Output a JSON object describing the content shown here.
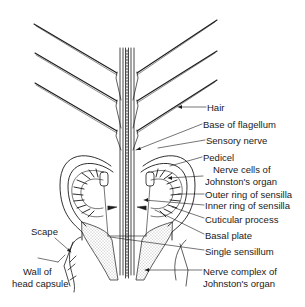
{
  "diagram": {
    "labels_right": [
      {
        "id": "hair",
        "text": "Hair",
        "x": 207,
        "y": 102
      },
      {
        "id": "base-of-flagellum",
        "text": "Base of flagellum",
        "x": 203,
        "y": 119
      },
      {
        "id": "sensory-nerve",
        "text": "Sensory nerve",
        "x": 206,
        "y": 135
      },
      {
        "id": "pedicel",
        "text": "Pedicel",
        "x": 203,
        "y": 152
      },
      {
        "id": "nerve-cells-1",
        "text": "Nerve cells of",
        "x": 213,
        "y": 164
      },
      {
        "id": "nerve-cells-2",
        "text": "Johnston's organ",
        "x": 205,
        "y": 176
      },
      {
        "id": "outer-ring",
        "text": "Outer ring of sensilla",
        "x": 205,
        "y": 189
      },
      {
        "id": "inner-ring",
        "text": "Inner ring of sensilla",
        "x": 205,
        "y": 200
      },
      {
        "id": "cuticular-process",
        "text": "Cuticular process",
        "x": 205,
        "y": 214
      },
      {
        "id": "basal-plate",
        "text": "Basal plate",
        "x": 205,
        "y": 230
      },
      {
        "id": "single-sensillum",
        "text": "Single sensillum",
        "x": 205,
        "y": 246
      },
      {
        "id": "nerve-complex-1",
        "text": "Nerve complex of",
        "x": 203,
        "y": 266
      },
      {
        "id": "nerve-complex-2",
        "text": "Johnston's organ",
        "x": 203,
        "y": 278
      }
    ],
    "labels_left": [
      {
        "id": "scape",
        "text": "Scape",
        "x": 31,
        "y": 226
      },
      {
        "id": "wall-1",
        "text": "Wall of",
        "x": 23,
        "y": 266
      },
      {
        "id": "wall-2",
        "text": "head capsule",
        "x": 12,
        "y": 278
      }
    ],
    "colors": {
      "ink": "#1a1a1a",
      "stipple": "#cfcfcf",
      "background": "#ffffff"
    }
  }
}
